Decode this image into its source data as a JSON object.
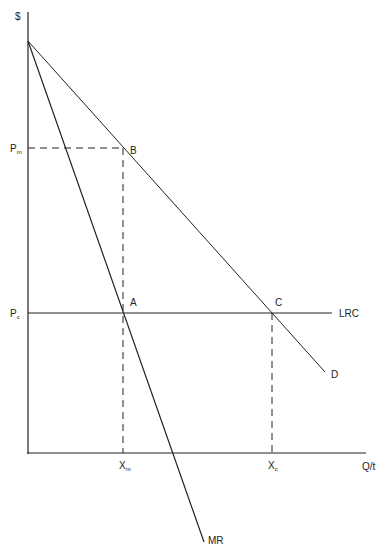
{
  "diagram": {
    "axes": {
      "y_label": "$",
      "x_label": "Q/t"
    },
    "price_labels": {
      "pm": {
        "main": "P",
        "sub": "m"
      },
      "pc": {
        "main": "P",
        "sub": "c"
      }
    },
    "quantity_labels": {
      "xm": {
        "main": "X",
        "sub": "m"
      },
      "xc": {
        "main": "X",
        "sub": "c"
      }
    },
    "points": {
      "a": "A",
      "b": "B",
      "c": "C"
    },
    "curves": {
      "demand": "D",
      "marginal_revenue": "MR",
      "long_run_cost": "LRC"
    },
    "colors": {
      "line": "#222222",
      "background": "#ffffff"
    }
  }
}
